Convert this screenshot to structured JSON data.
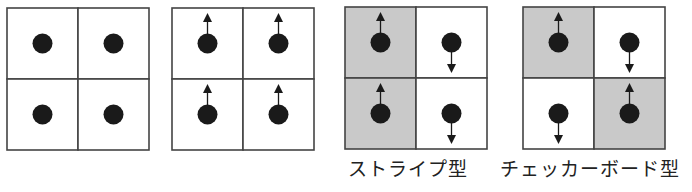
{
  "diagram": {
    "type": "spin-arrangement-lattices",
    "colors": {
      "line": "#444444",
      "atom": "#1a1a1a",
      "shaded": "#c9c9c9",
      "unshaded": "#ffffff"
    },
    "panels": [
      {
        "id": "no-spin",
        "label": "",
        "cells": [
          {
            "row": 0,
            "col": 0,
            "shaded": false,
            "spin": "none"
          },
          {
            "row": 0,
            "col": 1,
            "shaded": false,
            "spin": "none"
          },
          {
            "row": 1,
            "col": 0,
            "shaded": false,
            "spin": "none"
          },
          {
            "row": 1,
            "col": 1,
            "shaded": false,
            "spin": "none"
          }
        ]
      },
      {
        "id": "ferromagnetic",
        "label": "",
        "cells": [
          {
            "row": 0,
            "col": 0,
            "shaded": false,
            "spin": "up"
          },
          {
            "row": 0,
            "col": 1,
            "shaded": false,
            "spin": "up"
          },
          {
            "row": 1,
            "col": 0,
            "shaded": false,
            "spin": "up"
          },
          {
            "row": 1,
            "col": 1,
            "shaded": false,
            "spin": "up"
          }
        ]
      },
      {
        "id": "stripe",
        "label": "ストライプ型",
        "cells": [
          {
            "row": 0,
            "col": 0,
            "shaded": true,
            "spin": "up"
          },
          {
            "row": 0,
            "col": 1,
            "shaded": false,
            "spin": "down"
          },
          {
            "row": 1,
            "col": 0,
            "shaded": true,
            "spin": "up"
          },
          {
            "row": 1,
            "col": 1,
            "shaded": false,
            "spin": "down"
          }
        ]
      },
      {
        "id": "checkerboard",
        "label": "チェッカーボード型",
        "cells": [
          {
            "row": 0,
            "col": 0,
            "shaded": true,
            "spin": "up"
          },
          {
            "row": 0,
            "col": 1,
            "shaded": false,
            "spin": "down"
          },
          {
            "row": 1,
            "col": 0,
            "shaded": false,
            "spin": "down"
          },
          {
            "row": 1,
            "col": 1,
            "shaded": true,
            "spin": "up"
          }
        ]
      }
    ]
  }
}
